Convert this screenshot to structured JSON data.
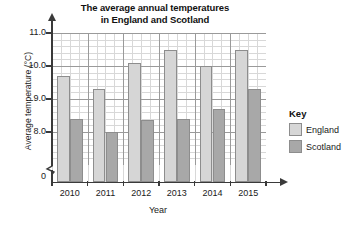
{
  "chart_data": {
    "type": "bar",
    "title": "The average annual temperatures in England and Scotland",
    "title_line1": "The average annual temperatures",
    "title_line2": "in England and Scotland",
    "xlabel": "Year",
    "ylabel": "Average temperature (°C)",
    "categories": [
      "2010",
      "2011",
      "2012",
      "2013",
      "2014",
      "2015"
    ],
    "series": [
      {
        "name": "England",
        "color": "#d6d6d6",
        "values": [
          9.7,
          9.3,
          10.1,
          10.5,
          10.0,
          10.5
        ]
      },
      {
        "name": "Scotland",
        "color": "#a8a8a8",
        "values": [
          8.4,
          8.0,
          8.35,
          8.4,
          8.7,
          9.3
        ]
      }
    ],
    "ylim": [
      8.0,
      11.0
    ],
    "y_axis_has_break": true,
    "y_zero_label": "0",
    "ytick_labels": [
      "11.0",
      "10.0",
      "9.0",
      "8.0"
    ],
    "ytick_values": [
      11.0,
      10.0,
      9.0,
      8.0
    ],
    "y_major_step": 1.0,
    "y_minor_step": 0.2,
    "grid": true,
    "grid_style": "minor and major squared grid",
    "legend_position": "right",
    "legend_title": "Key"
  },
  "legend": {
    "title": "Key",
    "entries": [
      {
        "label": "England",
        "swatch": "light-grey-swatch"
      },
      {
        "label": "Scotland",
        "swatch": "dark-grey-swatch"
      }
    ]
  },
  "icons": {
    "y_axis_arrow": "arrow-up-icon",
    "x_axis_arrow": "arrow-right-icon",
    "axis_break": "axis-break-squiggle-icon"
  }
}
